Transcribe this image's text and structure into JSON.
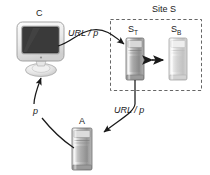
{
  "diagram": {
    "background_color": "#ffffff",
    "line_color": "#1a1a1a",
    "nodes": {
      "client": {
        "id": "C",
        "label": "C",
        "icon": "crt-monitor-icon",
        "type": "client workstation",
        "label_x": 36,
        "label_y": 14,
        "x": 18,
        "y": 22,
        "width": 46,
        "height": 38,
        "screen_color": "#333333",
        "bezel_color": "#e8e8e8"
      },
      "server_st": {
        "id": "S_T",
        "label_main": "S",
        "label_sub": "T",
        "icon": "tower-server-icon",
        "type": "server",
        "label_x": 128,
        "label_y": 27,
        "x": 126,
        "y": 38,
        "width": 18,
        "height": 42,
        "body_color": "#9a9a9a"
      },
      "server_sb": {
        "id": "S_B",
        "label_main": "S",
        "label_sub": "B",
        "icon": "tower-server-icon",
        "type": "server",
        "label_x": 171,
        "label_y": 27,
        "x": 169,
        "y": 38,
        "width": 18,
        "height": 42,
        "body_color": "#c9c9c9"
      },
      "server_a": {
        "id": "A",
        "label": "A",
        "icon": "tower-server-icon",
        "type": "server",
        "label_x": 80,
        "label_y": 120,
        "x": 72,
        "y": 128,
        "width": 20,
        "height": 42,
        "body_color": "#a8a8a8"
      }
    },
    "group": {
      "id": "site-s",
      "label": "Site S",
      "label_x": 160,
      "label_y": 10,
      "border_style": "dashed",
      "x": 110,
      "y": 19,
      "width": 92,
      "height": 72
    },
    "edges": [
      {
        "id": "c-to-st",
        "label": "URL / p",
        "label_x": 71,
        "label_y": 34,
        "from": "C",
        "to": "S_T",
        "arrowhead": "single"
      },
      {
        "id": "st-to-a",
        "label": "URL / p",
        "label_x": 117,
        "label_y": 110,
        "from": "S_T",
        "to": "A",
        "arrowhead": "single"
      },
      {
        "id": "a-to-c",
        "label": "p",
        "label_x": 35,
        "label_y": 111,
        "from": "A",
        "to": "C",
        "arrowhead": "single"
      },
      {
        "id": "st-sb-sync",
        "label": "",
        "from": "S_T",
        "to": "S_B",
        "arrowhead": "double"
      }
    ]
  }
}
